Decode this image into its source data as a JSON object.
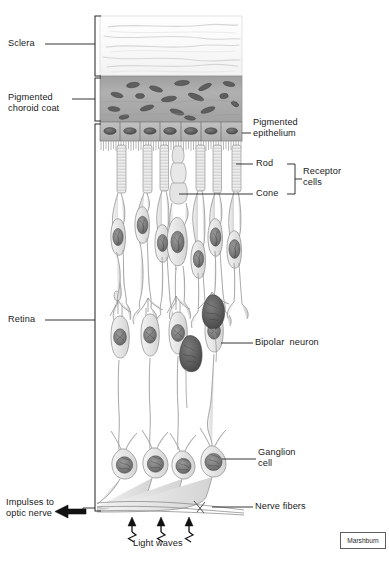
{
  "figure": {
    "credit": "Marshburn"
  },
  "labels_left": [
    {
      "id": "sclera",
      "text": "Sclera",
      "x": 8,
      "y": 38
    },
    {
      "id": "pigmented-choroid-coat",
      "text": "Pigmented\nchoroid coat",
      "x": 8,
      "y": 92
    },
    {
      "id": "retina",
      "text": "Retina",
      "x": 8,
      "y": 315
    },
    {
      "id": "impulses-to-optic-nerve",
      "text": "Impulses to\noptic nerve",
      "x": 6,
      "y": 497
    }
  ],
  "labels_right": [
    {
      "id": "pigmented-epithelium",
      "text": "Pigmented\nepithelium",
      "x": 253,
      "y": 118
    },
    {
      "id": "rod",
      "text": "Rod",
      "x": 255,
      "y": 160
    },
    {
      "id": "receptor-cells",
      "text": "Receptor\ncells",
      "x": 304,
      "y": 167
    },
    {
      "id": "cone",
      "text": "Cone",
      "x": 255,
      "y": 190
    },
    {
      "id": "bipolar-neuron",
      "text": "Bipolar  neuron",
      "x": 255,
      "y": 339
    },
    {
      "id": "ganglion-cell",
      "text": "Ganglion\ncell",
      "x": 258,
      "y": 448
    },
    {
      "id": "nerve-fibers",
      "text": "Nerve fibers",
      "x": 255,
      "y": 500
    }
  ],
  "labels_bottom": [
    {
      "id": "light-waves",
      "text": "Light waves",
      "x": 133,
      "y": 538
    }
  ],
  "layers": {
    "sclera": {
      "name": "Sclera",
      "top": 16,
      "bottom": 76,
      "fill": "#fdfdfd"
    },
    "choroid": {
      "name": "Pigmented choroid coat",
      "top": 76,
      "bottom": 122,
      "fill": "#a9a9a9"
    },
    "epithelium": {
      "name": "Pigmented epithelium",
      "top": 122,
      "bottom": 142,
      "fill": "#b9b9b9"
    },
    "retina": {
      "name": "Retina",
      "top": 122,
      "bottom": 512,
      "fill": "#ffffff"
    }
  },
  "colors": {
    "ink": "#1b1b1b",
    "leader": "#3b3b3b",
    "cell_outline": "#8e8e8e",
    "cell_fill": "#ededed",
    "nucleus_dark": "#6b6b6b",
    "nucleus_darker": "#555555",
    "choroid": "#a9a9a9",
    "choroid_cell": "#5f5f5f",
    "sclera": "#fdfdfd",
    "sclera_stroke": "#d8d8d8",
    "epithelium": "#bdbdbd",
    "arrow": "#111111"
  },
  "diagram_elements": {
    "receptor_count": 7,
    "cone_index": 3,
    "bipolar_count": 4,
    "ganglion_count": 4,
    "epithelium_cell_count": 7,
    "light_wave_arrows": 3,
    "choroid_melanocytes": 14
  }
}
